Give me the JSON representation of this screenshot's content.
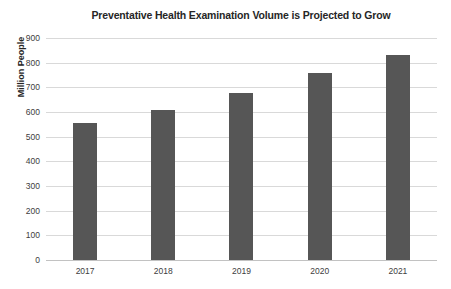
{
  "chart_data": {
    "type": "bar",
    "title": "Preventative Health Examination Volume is Projected to Grow",
    "xlabel": "",
    "ylabel": "Million People",
    "categories": [
      "2017",
      "2018",
      "2019",
      "2020",
      "2021"
    ],
    "values": [
      555,
      610,
      678,
      758,
      833
    ],
    "ylim": [
      0,
      900
    ],
    "ytick_labels": [
      "900",
      "800",
      "700",
      "600",
      "500",
      "400",
      "300",
      "200",
      "100",
      "0"
    ],
    "ytick_values": [
      900,
      800,
      700,
      600,
      500,
      400,
      300,
      200,
      100,
      0
    ],
    "grid": true,
    "legend": false,
    "bar_color": "#565656",
    "grid_color": "#d9d9d9",
    "axis_color": "#c2c2c2",
    "text_color": "#262626",
    "tick_text_color": "#404040",
    "background": "#ffffff"
  }
}
